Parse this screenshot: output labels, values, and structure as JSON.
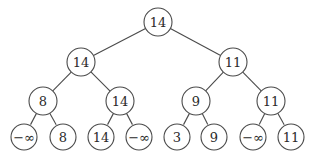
{
  "diagram": {
    "type": "binary-tree",
    "node_radius": 14,
    "nodes": [
      {
        "id": "n0",
        "label": "14",
        "x": 158,
        "y": 22,
        "level": 0
      },
      {
        "id": "n1",
        "label": "14",
        "x": 81,
        "y": 62,
        "level": 1
      },
      {
        "id": "n2",
        "label": "11",
        "x": 233,
        "y": 62,
        "level": 1
      },
      {
        "id": "n3",
        "label": "8",
        "x": 43,
        "y": 101,
        "level": 2
      },
      {
        "id": "n4",
        "label": "14",
        "x": 120,
        "y": 101,
        "level": 2
      },
      {
        "id": "n5",
        "label": "9",
        "x": 196,
        "y": 101,
        "level": 2
      },
      {
        "id": "n6",
        "label": "11",
        "x": 271,
        "y": 101,
        "level": 2
      },
      {
        "id": "n7",
        "label": "−∞",
        "x": 24,
        "y": 137,
        "level": 3
      },
      {
        "id": "n8",
        "label": "8",
        "x": 63,
        "y": 137,
        "level": 3
      },
      {
        "id": "n9",
        "label": "14",
        "x": 101,
        "y": 137,
        "level": 3
      },
      {
        "id": "n10",
        "label": "−∞",
        "x": 139,
        "y": 137,
        "level": 3
      },
      {
        "id": "n11",
        "label": "3",
        "x": 177,
        "y": 137,
        "level": 3
      },
      {
        "id": "n12",
        "label": "9",
        "x": 214,
        "y": 137,
        "level": 3
      },
      {
        "id": "n13",
        "label": "−∞",
        "x": 253,
        "y": 137,
        "level": 3
      },
      {
        "id": "n14",
        "label": "11",
        "x": 291,
        "y": 137,
        "level": 3
      }
    ],
    "edges": [
      [
        "n0",
        "n1"
      ],
      [
        "n0",
        "n2"
      ],
      [
        "n1",
        "n3"
      ],
      [
        "n1",
        "n4"
      ],
      [
        "n2",
        "n5"
      ],
      [
        "n2",
        "n6"
      ],
      [
        "n3",
        "n7"
      ],
      [
        "n3",
        "n8"
      ],
      [
        "n4",
        "n9"
      ],
      [
        "n4",
        "n10"
      ],
      [
        "n5",
        "n11"
      ],
      [
        "n5",
        "n12"
      ],
      [
        "n6",
        "n13"
      ],
      [
        "n6",
        "n14"
      ]
    ]
  }
}
